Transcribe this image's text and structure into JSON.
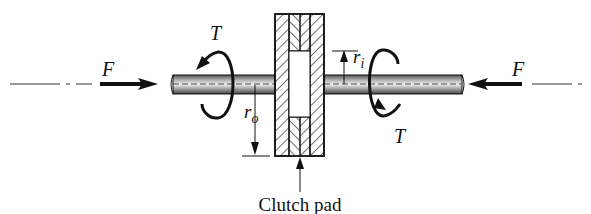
{
  "diagram": {
    "labels": {
      "force_left": "F",
      "force_right": "F",
      "torque_left": "T",
      "torque_right": "T",
      "outer_radius": "r",
      "outer_radius_sub": "o",
      "inner_radius": "r",
      "inner_radius_sub": "i",
      "caption": "Clutch pad"
    },
    "colors": {
      "line": "#111111",
      "background": "#ffffff"
    }
  }
}
